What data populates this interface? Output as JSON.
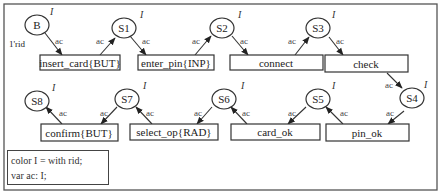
{
  "diagram": {
    "type": "colored-petri-net",
    "initial_marking": "1'rid",
    "places": [
      {
        "id": "B",
        "label": "B",
        "color": "I"
      },
      {
        "id": "S1",
        "label": "S1",
        "color": "I"
      },
      {
        "id": "S2",
        "label": "S2",
        "color": "I"
      },
      {
        "id": "S3",
        "label": "S3",
        "color": "I"
      },
      {
        "id": "S4",
        "label": "S4",
        "color": "I"
      },
      {
        "id": "S5",
        "label": "S5",
        "color": "I"
      },
      {
        "id": "S6",
        "label": "S6",
        "color": "I"
      },
      {
        "id": "S7",
        "label": "S7",
        "color": "I"
      },
      {
        "id": "S8",
        "label": "S8",
        "color": "I"
      }
    ],
    "transitions": [
      {
        "id": "t1",
        "label": "insert_card{BUT}"
      },
      {
        "id": "t2",
        "label": "enter_pin{INP}"
      },
      {
        "id": "t3",
        "label": "connect"
      },
      {
        "id": "t4",
        "label": "check"
      },
      {
        "id": "t5",
        "label": "pin_ok"
      },
      {
        "id": "t6",
        "label": "card_ok"
      },
      {
        "id": "t7",
        "label": "select_op{RAD}"
      },
      {
        "id": "t8",
        "label": "confirm{BUT}"
      }
    ],
    "arcs": [
      {
        "from": "B",
        "to": "t1",
        "label": "ac"
      },
      {
        "from": "t1",
        "to": "S1",
        "label": "ac"
      },
      {
        "from": "S1",
        "to": "t2",
        "label": "ac"
      },
      {
        "from": "t2",
        "to": "S2",
        "label": "ac"
      },
      {
        "from": "S2",
        "to": "t3",
        "label": "ac"
      },
      {
        "from": "t3",
        "to": "S3",
        "label": "ac"
      },
      {
        "from": "S3",
        "to": "t4",
        "label": "ac"
      },
      {
        "from": "t4",
        "to": "S4",
        "label": "ac"
      },
      {
        "from": "S4",
        "to": "t5",
        "label": "ac"
      },
      {
        "from": "t5",
        "to": "S5",
        "label": "ac"
      },
      {
        "from": "S5",
        "to": "t6",
        "label": "ac"
      },
      {
        "from": "t6",
        "to": "S6",
        "label": "ac"
      },
      {
        "from": "S6",
        "to": "t7",
        "label": "ac"
      },
      {
        "from": "t7",
        "to": "S7",
        "label": "ac"
      },
      {
        "from": "S7",
        "to": "t8",
        "label": "ac"
      },
      {
        "from": "t8",
        "to": "S8",
        "label": "ac"
      }
    ],
    "declarations": [
      "color I = with rid;",
      "var ac: I;"
    ]
  }
}
